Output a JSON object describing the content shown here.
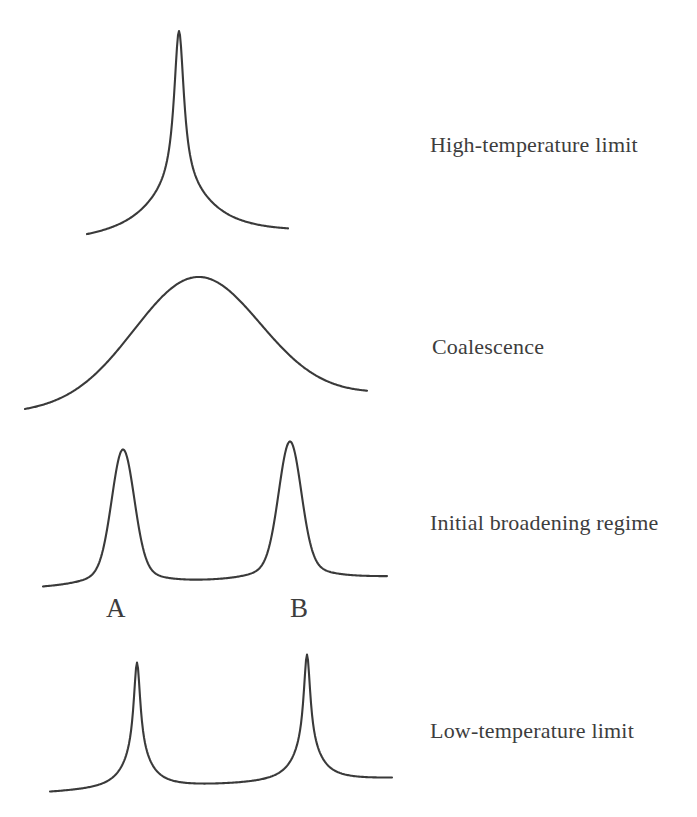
{
  "figure": {
    "type": "dynamic-nmr-lineshape-diagram",
    "background": "#ffffff",
    "stroke_color": "#3a3a3a",
    "text_color": "#3d3d3d",
    "panels": [
      {
        "id": "high-temperature-limit",
        "label": "High-temperature limit",
        "curve": {
          "x_start": 87,
          "x_end": 288,
          "baseline_left": 243,
          "baseline_right": 235,
          "peaks": [
            {
              "center": 179,
              "apex_y": 31,
              "components": [
                {
                  "shape": "lorentzian",
                  "width": 6,
                  "share": 0.75
                },
                {
                  "shape": "lorentzian",
                  "width": 40,
                  "share": 0.25
                }
              ]
            }
          ]
        }
      },
      {
        "id": "coalescence",
        "label": "Coalescence",
        "curve": {
          "x_start": 25,
          "x_end": 367,
          "baseline_left": 412,
          "baseline_right": 394,
          "peaks": [
            {
              "center": 197,
              "apex_y": 277,
              "components": [
                {
                  "shape": "gaussian",
                  "width": 63,
                  "share": 1.0
                }
              ]
            }
          ]
        }
      },
      {
        "id": "initial-broadening-regime",
        "label": "Initial broadening regime",
        "site_labels": [
          {
            "text": "A"
          },
          {
            "text": "B"
          }
        ],
        "curve": {
          "x_start": 43,
          "x_end": 387,
          "baseline_left": 589,
          "baseline_right": 578,
          "peaks": [
            {
              "center": 123,
              "apex_y": 450,
              "components": [
                {
                  "shape": "gaussian",
                  "width": 11,
                  "share": 0.81
                },
                {
                  "shape": "lorentzian",
                  "width": 25,
                  "share": 0.19
                }
              ]
            },
            {
              "center": 290,
              "apex_y": 442,
              "components": [
                {
                  "shape": "gaussian",
                  "width": 11,
                  "share": 0.81
                },
                {
                  "shape": "lorentzian",
                  "width": 25,
                  "share": 0.19
                }
              ]
            }
          ]
        }
      },
      {
        "id": "low-temperature-limit",
        "label": "Low-temperature limit",
        "curve": {
          "x_start": 50,
          "x_end": 392,
          "baseline_left": 793,
          "baseline_right": 779,
          "peaks": [
            {
              "center": 137,
              "apex_y": 663,
              "components": [
                {
                  "shape": "lorentzian",
                  "width": 4,
                  "share": 0.73
                },
                {
                  "shape": "lorentzian",
                  "width": 16,
                  "share": 0.27
                }
              ]
            },
            {
              "center": 307,
              "apex_y": 655,
              "components": [
                {
                  "shape": "lorentzian",
                  "width": 4,
                  "share": 0.73
                },
                {
                  "shape": "lorentzian",
                  "width": 16,
                  "share": 0.27
                }
              ]
            }
          ]
        }
      }
    ]
  }
}
